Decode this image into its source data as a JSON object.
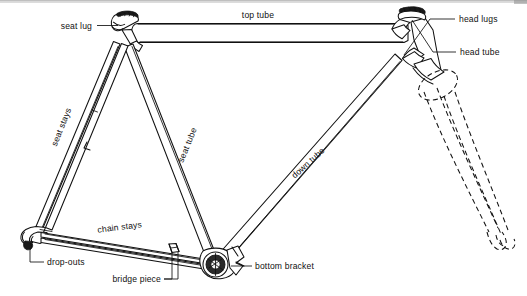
{
  "diagram": {
    "background_color": "#ffffff",
    "line_color": "#111111",
    "edge_band_color": "#b9b9b9",
    "width": 527,
    "height": 296
  },
  "labels": {
    "top_tube": "top tube",
    "seat_lug": "seat lug",
    "head_lugs": "head lugs",
    "head_tube": "head tube",
    "seat_stays": "seat stays",
    "seat_tube": "seat tube",
    "down_tube": "down tube",
    "chain_stays": "chain stays",
    "drop_outs": "drop-outs",
    "bridge_piece": "bridge piece",
    "bottom_bracket": "bottom bracket"
  },
  "parts": [
    {
      "id": "top-tube",
      "label": "top tube",
      "label_x": 258,
      "label_y": 15,
      "rotation": 0
    },
    {
      "id": "seat-lug",
      "label": "seat lug",
      "label_x": 60,
      "label_y": 28,
      "rotation": 0
    },
    {
      "id": "head-lugs",
      "label": "head lugs",
      "label_x": 459,
      "label_y": 22,
      "rotation": 0
    },
    {
      "id": "head-tube",
      "label": "head tube",
      "label_x": 461,
      "label_y": 55,
      "rotation": 0
    },
    {
      "id": "seat-stays",
      "label": "seat stays",
      "label_x": 64,
      "label_y": 128,
      "rotation": -72
    },
    {
      "id": "seat-tube",
      "label": "seat tube",
      "label_x": 189,
      "label_y": 146,
      "rotation": -72
    },
    {
      "id": "down-tube",
      "label": "down tube",
      "label_x": 309,
      "label_y": 166,
      "rotation": -42
    },
    {
      "id": "chain-stays",
      "label": "chain stays",
      "label_x": 95,
      "label_y": 230,
      "rotation": -6
    },
    {
      "id": "drop-outs",
      "label": "drop-outs",
      "label_x": 48,
      "label_y": 265,
      "rotation": 0
    },
    {
      "id": "bridge-piece",
      "label": "bridge piece",
      "label_x": 108,
      "label_y": 282,
      "rotation": 0
    },
    {
      "id": "bottom-bracket",
      "label": "bottom bracket",
      "label_x": 256,
      "label_y": 269,
      "rotation": 0
    }
  ],
  "features": {
    "fork_style": "dashed-outline",
    "bottom_bracket_shell": "hatched-circle",
    "seat_lug_detail": "hatched-collar",
    "head_lug_detail": "hatched-collar"
  }
}
